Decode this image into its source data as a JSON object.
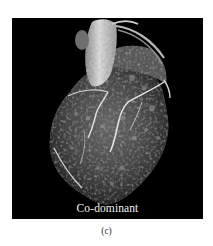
{
  "figure": {
    "panel": {
      "image_description": "3D volume-rendered CT angiography of the heart showing coronary arteries",
      "label": "Co-dominant",
      "background_color": "#000000",
      "label_color": "#f2f2f2"
    },
    "caption": "(c)"
  }
}
